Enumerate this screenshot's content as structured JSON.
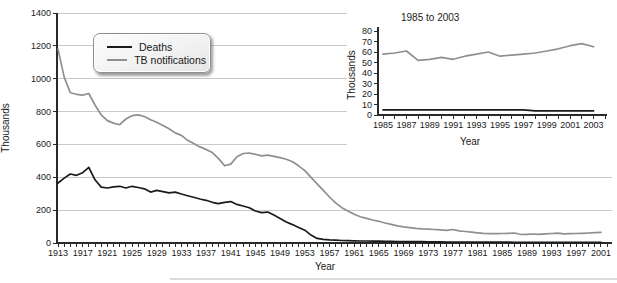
{
  "legend": {
    "items": [
      {
        "label": "Deaths",
        "color": "#1a1a1a"
      },
      {
        "label": "TB notifications",
        "color": "#8f8f8f"
      }
    ]
  },
  "chart_data": [
    {
      "id": "main",
      "type": "line",
      "title": "",
      "xlabel": "Year",
      "ylabel": "Thousands",
      "ylim": [
        0,
        1400
      ],
      "ytick_interval": 200,
      "grid": true,
      "legend_position": "top-left",
      "x_years": {
        "start": 1913,
        "end": 2001,
        "step": 1
      },
      "xtick_label_interval": 4,
      "xtick_labels": [
        1913,
        1917,
        1921,
        1925,
        1929,
        1933,
        1937,
        1941,
        1945,
        1949,
        1953,
        1957,
        1961,
        1965,
        1969,
        1973,
        1977,
        1981,
        1985,
        1989,
        1993,
        1997,
        2001
      ],
      "series": [
        {
          "name": "Deaths",
          "color": "#1a1a1a",
          "values": [
            365,
            395,
            420,
            412,
            428,
            460,
            385,
            340,
            335,
            342,
            345,
            335,
            345,
            338,
            330,
            310,
            320,
            313,
            305,
            310,
            298,
            288,
            278,
            268,
            260,
            248,
            240,
            248,
            252,
            235,
            225,
            215,
            195,
            185,
            188,
            170,
            150,
            128,
            112,
            95,
            78,
            48,
            28,
            22,
            19,
            17,
            15,
            14,
            13,
            12,
            12,
            11,
            11,
            10,
            10,
            9,
            9,
            8,
            8,
            8,
            7,
            7,
            7,
            6,
            6,
            6,
            6,
            5,
            5,
            5,
            5,
            5,
            5,
            5,
            4,
            4,
            4,
            4,
            4,
            4,
            4,
            4,
            4,
            4,
            4,
            4,
            4,
            4,
            4
          ]
        },
        {
          "name": "TB notifications",
          "color": "#8f8f8f",
          "values": [
            1180,
            1010,
            915,
            905,
            900,
            910,
            840,
            780,
            745,
            730,
            720,
            755,
            775,
            780,
            770,
            750,
            735,
            715,
            695,
            670,
            655,
            625,
            605,
            585,
            570,
            550,
            515,
            470,
            480,
            525,
            545,
            548,
            540,
            530,
            535,
            528,
            520,
            510,
            495,
            470,
            440,
            400,
            360,
            320,
            280,
            245,
            215,
            195,
            175,
            160,
            150,
            140,
            132,
            122,
            113,
            105,
            98,
            93,
            89,
            86,
            84,
            82,
            80,
            77,
            82,
            74,
            70,
            66,
            62,
            59,
            57,
            57,
            58,
            59,
            61,
            52,
            53,
            55,
            53,
            56,
            58,
            60,
            56,
            57,
            58,
            59,
            61,
            63,
            65
          ]
        }
      ]
    },
    {
      "id": "inset",
      "type": "line",
      "title": "1985 to 2003",
      "xlabel": "Year",
      "ylabel": "Thousands",
      "ylim": [
        0,
        80
      ],
      "ytick_interval": 10,
      "grid": false,
      "x_years": {
        "start": 1985,
        "end": 2003,
        "step": 1
      },
      "xtick_label_interval": 2,
      "xtick_labels": [
        1985,
        1987,
        1989,
        1991,
        1993,
        1995,
        1997,
        1999,
        2001,
        2003
      ],
      "series": [
        {
          "name": "Deaths",
          "color": "#1a1a1a",
          "values": [
            5,
            5,
            5,
            5,
            5,
            5,
            5,
            5,
            5,
            5,
            5,
            5,
            5,
            4,
            4,
            4,
            4,
            4,
            4
          ]
        },
        {
          "name": "TB notifications",
          "color": "#8f8f8f",
          "values": [
            58,
            59,
            61,
            52,
            53,
            55,
            53,
            56,
            58,
            60,
            56,
            57,
            58,
            59,
            61,
            63,
            66,
            68,
            65
          ]
        }
      ]
    }
  ]
}
